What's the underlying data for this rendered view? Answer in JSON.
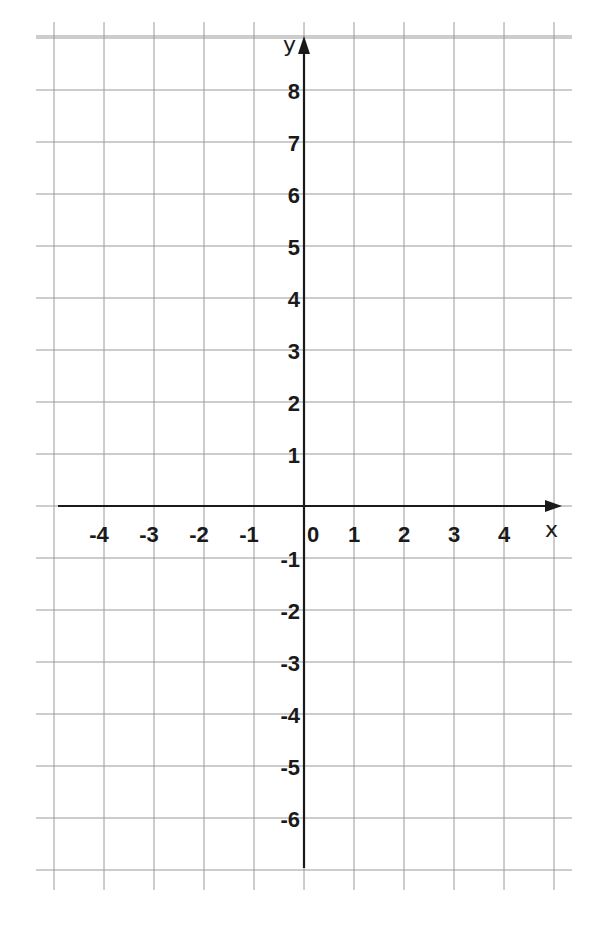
{
  "chart_data": {
    "type": "line",
    "title": "",
    "xlabel": "x",
    "ylabel": "y",
    "xlim": [
      -5,
      5
    ],
    "ylim": [
      -7,
      9
    ],
    "grid": true,
    "x_tick_labels": [
      "-4",
      "-3",
      "-2",
      "-1",
      "0",
      "1",
      "2",
      "3",
      "4"
    ],
    "x_tick_values": [
      -4,
      -3,
      -2,
      -1,
      0,
      1,
      2,
      3,
      4
    ],
    "y_tick_labels": [
      "8",
      "7",
      "6",
      "5",
      "4",
      "3",
      "2",
      "1",
      "-1",
      "-2",
      "-3",
      "-4",
      "-5",
      "-6"
    ],
    "y_tick_values": [
      8,
      7,
      6,
      5,
      4,
      3,
      2,
      1,
      -1,
      -2,
      -3,
      -4,
      -5,
      -6
    ],
    "series": [],
    "legend": null
  },
  "colors": {
    "grid": "#9a9a9a",
    "axis": "#1a1a1a",
    "background": "#ffffff"
  }
}
